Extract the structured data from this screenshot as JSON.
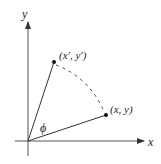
{
  "diagram": {
    "type": "rotation-of-point",
    "colors": {
      "stroke": "#333333",
      "text": "#222222",
      "background": "#ffffff"
    },
    "axes": {
      "x_label": "x",
      "y_label": "y",
      "origin": [
        28,
        141
      ]
    },
    "points": [
      {
        "id": "original",
        "label": "(x, y)",
        "pos": [
          106,
          115
        ]
      },
      {
        "id": "rotated",
        "label": "(x′, y′)",
        "pos": [
          54,
          62
        ]
      }
    ],
    "angle": {
      "label": "ϕ"
    },
    "arc": {
      "style": "dashed",
      "from": "rotated",
      "to": "original"
    }
  }
}
